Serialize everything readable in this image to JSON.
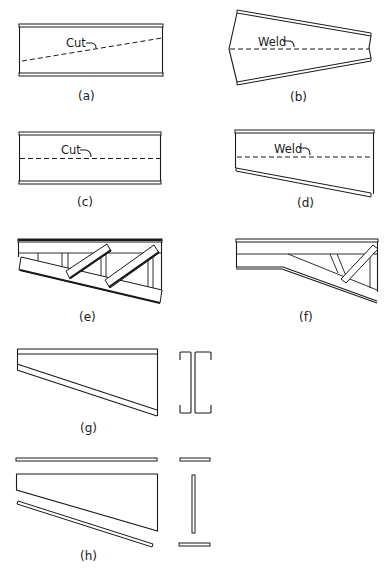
{
  "figure": {
    "panels": [
      {
        "id": "a",
        "label": "(a)",
        "annotation": "Cut",
        "description": "Rolled I-beam with diagonal dashed cut line across web"
      },
      {
        "id": "b",
        "label": "(b)",
        "annotation": "Weld",
        "description": "Two halves flipped and welded along the dashed centerline forming a tapered member"
      },
      {
        "id": "c",
        "label": "(c)",
        "annotation": "Cut",
        "description": "Rolled I-beam with horizontal dashed cut line"
      },
      {
        "id": "d",
        "label": "(d)",
        "annotation": "Weld",
        "description": "Upper half welded to inclined lower portion forming a tapered girder"
      },
      {
        "id": "e",
        "label": "(e)",
        "description": "Tapered truss-like girder with inclined bottom chord, vertical posts and diagonal members"
      },
      {
        "id": "f",
        "label": "(f)",
        "description": "Haunched girder with horizontal left portion and inclined haunch with diagonal brace"
      },
      {
        "id": "g",
        "label": "(g)",
        "description": "Tapered member built from two back-to-back channels (section shown at right)"
      },
      {
        "id": "h",
        "label": "(h)",
        "description": "Built-up tapered plate girder exploded into top flange, web, bottom flange (section plates at right)"
      }
    ]
  },
  "colors": {
    "line": "#1a1a1a",
    "background": "#ffffff"
  }
}
